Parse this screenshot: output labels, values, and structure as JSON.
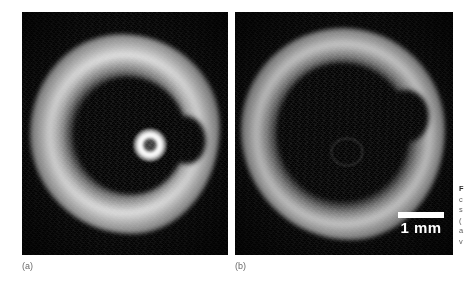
{
  "page": {
    "background_color": "#ffffff",
    "width": 473,
    "height": 292
  },
  "figure": {
    "panels": [
      {
        "id": "a",
        "letter": "(a)",
        "background_color": "#050505",
        "description": "cross-sectional scan with bright annular vessel wall, dark lumen and bright central catheter ring artifact"
      },
      {
        "id": "b",
        "letter": "(b)",
        "background_color": "#050505",
        "description": "cross-sectional scan with bright annular vessel wall, larger dark lumen and faint central ring artifact"
      }
    ],
    "scalebar": {
      "label": "1 mm",
      "color": "#ffffff",
      "length_px": 46,
      "panel": "b"
    },
    "caption": {
      "clipped": true,
      "lines": [
        "F",
        "c",
        "s",
        "(",
        "a",
        "v"
      ],
      "title_marker": "F"
    }
  },
  "colors": {
    "page_background": "#ffffff",
    "panel_background": "#050505",
    "scalebar": "#ffffff",
    "panel_letter": "#6b6b6b",
    "caption_text": "#5d5d5d",
    "caption_title": "#2b2b2b",
    "tissue_bright": "#f4f4f4"
  }
}
